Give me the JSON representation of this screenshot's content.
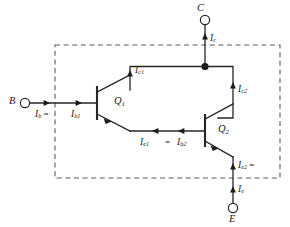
{
  "diagram": {
    "colors": {
      "wire": "#262626",
      "dashed_box": "#5a5a5a",
      "background": "#ffffff",
      "node_dot": "#111111"
    },
    "terminals": [
      {
        "id": "collector",
        "label": "C",
        "position": "top"
      },
      {
        "id": "base",
        "label": "B",
        "position": "left"
      },
      {
        "id": "emitter",
        "label": "E",
        "position": "bottom"
      }
    ],
    "devices": [
      {
        "id": "q1",
        "label": "Q",
        "subscript": "1",
        "type": "npn-transistor"
      },
      {
        "id": "q2",
        "label": "Q",
        "subscript": "2",
        "type": "npn-transistor"
      }
    ],
    "currents": {
      "ic": {
        "symbol": "I",
        "subscript": "c",
        "text": ""
      },
      "ic1": {
        "symbol": "I",
        "subscript": "c1",
        "text": ""
      },
      "ic2": {
        "symbol": "I",
        "subscript": "c2",
        "text": ""
      },
      "ib": {
        "symbol": "I",
        "subscript": "b",
        "text": " ="
      },
      "ib1": {
        "symbol": "I",
        "subscript": "b1",
        "text": ""
      },
      "ie1": {
        "symbol": "I",
        "subscript": "e1",
        "text": ""
      },
      "equals": {
        "text": "="
      },
      "ib2": {
        "symbol": "I",
        "subscript": "b2",
        "text": ""
      },
      "ie2": {
        "symbol": "I",
        "subscript": "e2",
        "text": " ="
      },
      "ie": {
        "symbol": "I",
        "subscript": "e",
        "text": ""
      }
    }
  }
}
